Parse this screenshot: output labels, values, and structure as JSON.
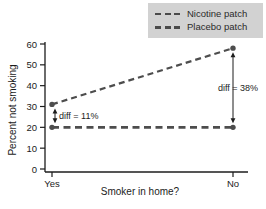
{
  "figure": {
    "background": "#ffffff"
  },
  "legend": {
    "bg_color": "#d2d2d2",
    "position": "top-right"
  },
  "chart_data": {
    "type": "line",
    "title": "",
    "xlabel": "Smoker in home?",
    "ylabel": "Percent not smoking",
    "categories": [
      "Yes",
      "No"
    ],
    "ylim": [
      0,
      60
    ],
    "yticks": [
      0,
      10,
      20,
      30,
      40,
      50,
      60
    ],
    "grid": false,
    "legend_position": "top-right",
    "series": [
      {
        "name": "Nicotine patch",
        "values": [
          31,
          58
        ],
        "color": "#4d4d4d",
        "line_style": "dashed",
        "width": 2.2
      },
      {
        "name": "Placebo patch",
        "values": [
          20,
          20
        ],
        "color": "#4d4d4d",
        "line_style": "dashed",
        "width": 2.8
      }
    ],
    "annotations": [
      {
        "label": "diff = 11%",
        "category_index": 0,
        "from": 20,
        "to": 31,
        "label_side": "right"
      },
      {
        "label": "diff = 38%",
        "category_index": 1,
        "from": 20,
        "to": 58,
        "label_side": "center"
      }
    ],
    "axis_color": "#1c1c1c",
    "text_color": "#1c1c1c"
  }
}
